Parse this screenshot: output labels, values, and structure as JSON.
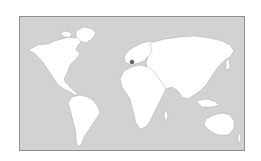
{
  "map": {
    "type": "world-map",
    "background_color": "#d2d2d2",
    "land_color": "#ffffff",
    "border_color": "#8f8f8f",
    "marker": {
      "label": "location-marker",
      "region": "Western Europe (Spain/France)",
      "color": "#5a5a5a"
    },
    "continents": [
      "North America",
      "South America",
      "Europe",
      "Africa",
      "Asia",
      "Australia"
    ]
  }
}
